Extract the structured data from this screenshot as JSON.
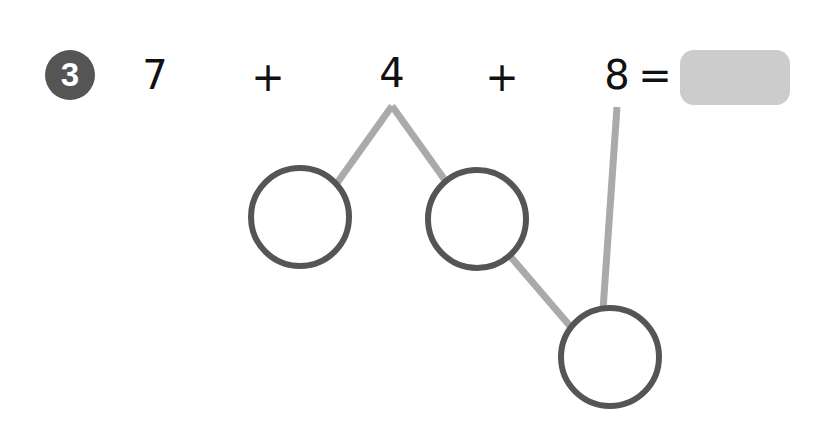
{
  "problem": {
    "number": "3",
    "terms": [
      "7",
      "+",
      "4",
      "+",
      "8",
      "="
    ],
    "answer": ""
  },
  "colors": {
    "badge": "#555555",
    "circle_stroke": "#555555",
    "connector": "#aaaaaa",
    "answer_box": "#cccccc"
  }
}
